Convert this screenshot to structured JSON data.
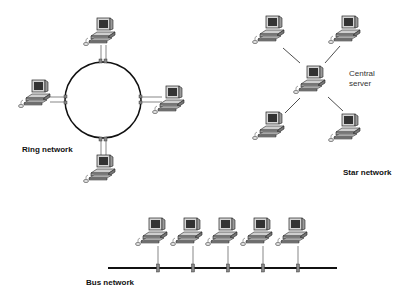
{
  "diagram": {
    "ring": {
      "label": "Ring network",
      "nodes": [
        "top",
        "left",
        "right",
        "bottom"
      ]
    },
    "star": {
      "label": "Star network",
      "center_label_line1": "Central",
      "center_label_line2": "server",
      "nodes": [
        "top-left",
        "top-right",
        "bottom-left",
        "bottom-right"
      ]
    },
    "bus": {
      "label": "Bus network",
      "node_count": 5
    },
    "colors": {
      "line": "#111111",
      "monitor_screen": "#333333",
      "monitor_body": "#bbbbbb",
      "keyboard": "#999999",
      "connector": "#888888"
    }
  }
}
